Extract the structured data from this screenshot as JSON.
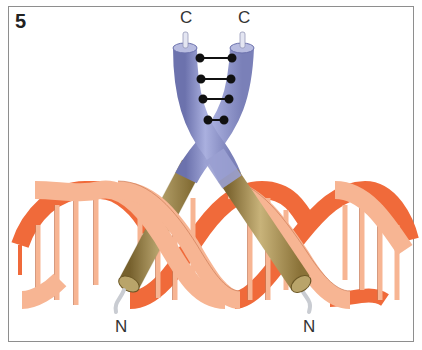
{
  "figure": {
    "panel_number": "5",
    "labels": {
      "c_terminus_left": "C",
      "c_terminus_right": "C",
      "n_terminus_left": "N",
      "n_terminus_right": "N"
    },
    "components": [
      {
        "name": "alpha-helix-left",
        "color_upper": "#8d93c8",
        "color_lower": "#a08a4c"
      },
      {
        "name": "alpha-helix-right",
        "color_upper": "#8d93c8",
        "color_lower": "#a08a4c"
      },
      {
        "name": "zipper-bonds",
        "count": 4,
        "color": "#111111"
      },
      {
        "name": "dna-double-helix",
        "color_front": "#f6b48e",
        "color_back": "#f06a3a"
      }
    ]
  }
}
